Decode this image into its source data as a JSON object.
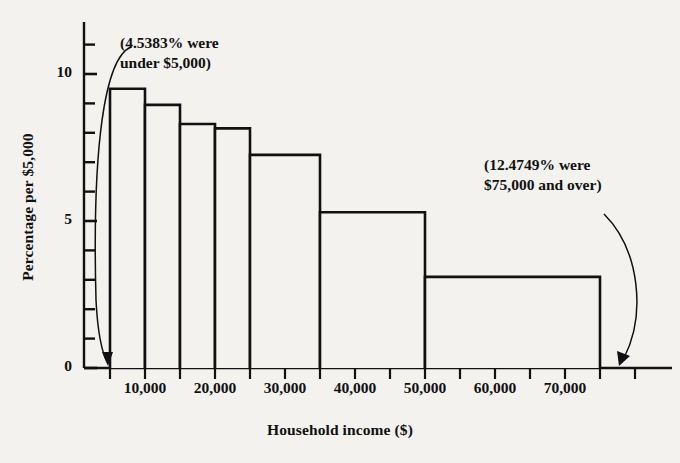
{
  "chart_data": {
    "type": "bar",
    "title": "",
    "subtitle": "",
    "xlabel": "Household income ($)",
    "ylabel": "Percentage per $5,000",
    "xlim": [
      0,
      80000
    ],
    "ylim": [
      0,
      11.5
    ],
    "grid": false,
    "legend": null,
    "x_tick_step": 5000,
    "x_tick_label_step": 10000,
    "y_tick_step": 1,
    "y_tick_label_step": 5,
    "x_tick_labels": [
      "10,000",
      "20,000",
      "30,000",
      "40,000",
      "50,000",
      "60,000",
      "70,000"
    ],
    "x_tick_label_values": [
      10000,
      20000,
      30000,
      40000,
      50000,
      60000,
      70000
    ],
    "y_tick_labels": [
      "0",
      "5",
      "10"
    ],
    "y_tick_label_values": [
      0,
      5,
      10
    ],
    "bars": [
      {
        "x0": 5000,
        "x1": 10000,
        "height": 9.5
      },
      {
        "x0": 10000,
        "x1": 15000,
        "height": 8.95
      },
      {
        "x0": 15000,
        "x1": 20000,
        "height": 8.3
      },
      {
        "x0": 20000,
        "x1": 25000,
        "height": 8.15
      },
      {
        "x0": 25000,
        "x1": 35000,
        "height": 7.25
      },
      {
        "x0": 35000,
        "x1": 50000,
        "height": 5.3
      },
      {
        "x0": 50000,
        "x1": 75000,
        "height": 3.1
      }
    ],
    "annotations": [
      {
        "id": "left",
        "text": "(4.5383% were\nunder $5,000)",
        "target_x": 5000,
        "target_y": 0
      },
      {
        "id": "right",
        "text": "(12.4749% were\n$75,000 and over)",
        "target_x": 75000,
        "target_y": 0
      }
    ],
    "colors": {
      "background": "#f3f2ef",
      "ink": "#111111",
      "bar_fill": "#f3f2ef",
      "bar_stroke": "#111111"
    }
  }
}
